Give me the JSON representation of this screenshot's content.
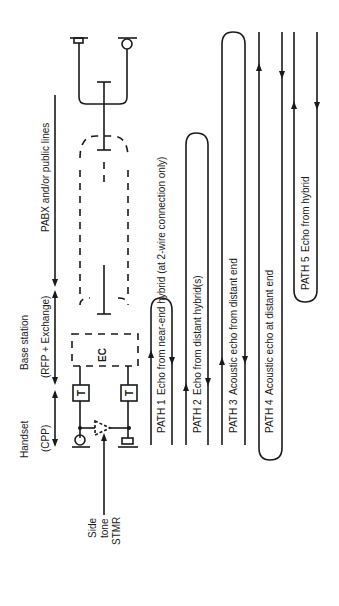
{
  "diagram": {
    "orientation": "rotated-90-ccw",
    "sections": {
      "handset": {
        "label": "Handset",
        "sublabel": "(CPP)"
      },
      "base_station": {
        "label": "Base station",
        "sublabel": "(RFP + Exchange)"
      },
      "pabx": {
        "label": "PABX and/or public lines"
      }
    },
    "components": {
      "transmitter_top": "T",
      "transmitter_bottom": "T",
      "echo_canceller": "EC"
    },
    "sidetone": {
      "line1": "Side",
      "line2": "tone",
      "line3": "STMR"
    },
    "paths": [
      {
        "id": "PATH 1",
        "label": "Echo from near-end hybrid (at 2-wire connection only)"
      },
      {
        "id": "PATH 2",
        "label": "Echo from distant hybrid(s)"
      },
      {
        "id": "PATH 3",
        "label": "Acoustic echo from distant end"
      },
      {
        "id": "PATH 4",
        "label": "Acoustic echo at distant end"
      },
      {
        "id": "PATH 5",
        "label": "Echo from hybrid"
      }
    ]
  }
}
